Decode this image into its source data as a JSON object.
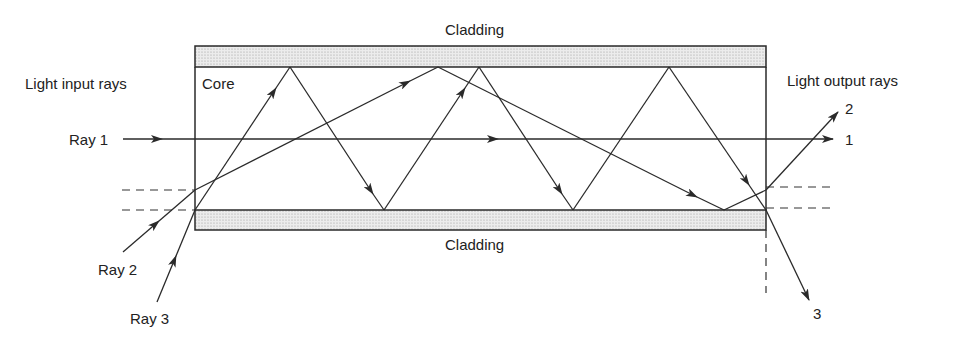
{
  "diagram": {
    "labels": {
      "cladding_top": "Cladding",
      "cladding_bottom": "Cladding",
      "core": "Core",
      "input_heading": "Light input rays",
      "output_heading": "Light output rays",
      "ray1": "Ray 1",
      "ray2": "Ray 2",
      "ray3": "Ray 3",
      "out1": "1",
      "out2": "2",
      "out3": "3"
    },
    "colors": {
      "line": "#2a2a2a",
      "cladding_fill": "#e6e6e6",
      "cladding_dots": "#9a9a9a",
      "background": "#ffffff"
    },
    "rays": [
      {
        "name": "Ray 1",
        "path": [
          [
            123,
            139
          ],
          [
            833,
            139
          ]
        ]
      },
      {
        "name": "Ray 2",
        "path": [
          [
            123,
            252
          ],
          [
            195,
            190
          ],
          [
            438,
            67
          ],
          [
            724,
            210
          ],
          [
            766,
            190
          ],
          [
            838,
            112
          ]
        ]
      },
      {
        "name": "Ray 3",
        "path": [
          [
            157,
            302
          ],
          [
            195,
            210
          ],
          [
            290,
            67
          ],
          [
            384,
            210
          ],
          [
            479,
            67
          ],
          [
            573,
            210
          ],
          [
            669,
            67
          ],
          [
            766,
            210
          ],
          [
            809,
            300
          ]
        ]
      }
    ]
  }
}
